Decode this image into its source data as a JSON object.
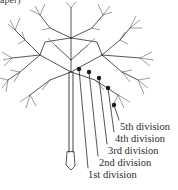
{
  "figure": {
    "caption_fragment": "aper)",
    "labels": [
      {
        "text": "5th division",
        "x": 120,
        "y": 121
      },
      {
        "text": "4th division",
        "x": 115,
        "y": 133
      },
      {
        "text": "3rd division",
        "x": 108,
        "y": 145
      },
      {
        "text": "2nd division",
        "x": 99,
        "y": 157
      },
      {
        "text": "1st division",
        "x": 88,
        "y": 169
      }
    ],
    "nodes": [
      {
        "x": 79,
        "y": 69
      },
      {
        "x": 89,
        "y": 72
      },
      {
        "x": 99,
        "y": 78
      },
      {
        "x": 108,
        "y": 88
      },
      {
        "x": 114,
        "y": 105
      }
    ],
    "colors": {
      "ink": "#2a2a2a",
      "background": "#ffffff"
    }
  }
}
